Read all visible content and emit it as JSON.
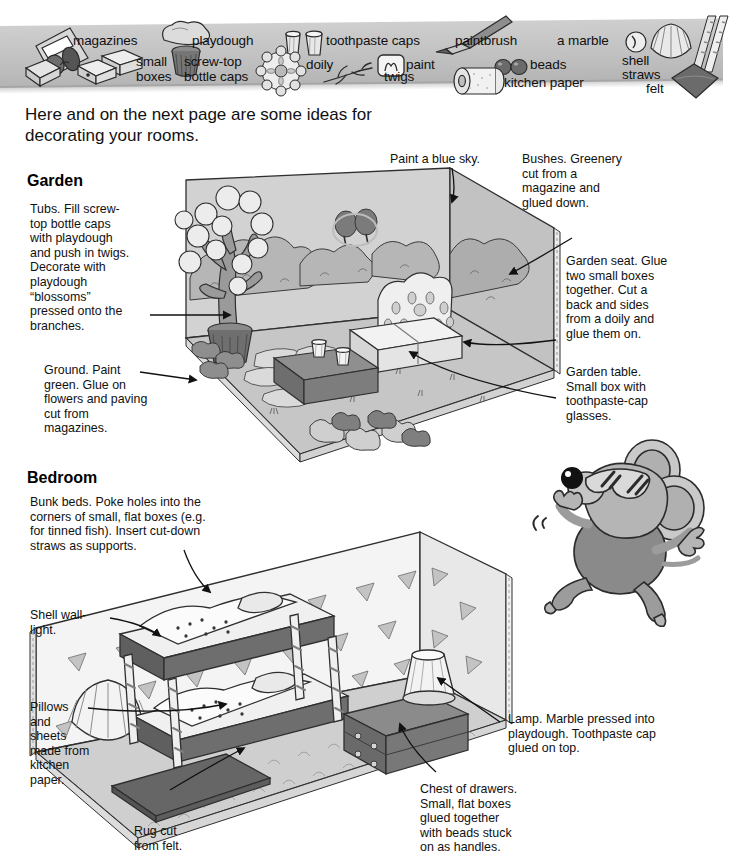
{
  "page": {
    "intro": "Here and on the next page are some ideas for decorating your rooms."
  },
  "banner": {
    "name": "materials-banner",
    "materials": [
      {
        "id": "magazines",
        "label": "magazines",
        "icon": "magazine-icon"
      },
      {
        "id": "small-boxes",
        "label": "small\nboxes",
        "icon": "small-boxes-icon"
      },
      {
        "id": "playdough",
        "label": "playdough",
        "icon": "playdough-blob-icon"
      },
      {
        "id": "screw-top-caps",
        "label": "screw-top\nbottle caps",
        "icon": "bottle-cap-icon"
      },
      {
        "id": "toothpaste-caps",
        "label": "toothpaste caps",
        "icon": "toothpaste-cap-icon"
      },
      {
        "id": "doily",
        "label": "doily",
        "icon": "doily-icon"
      },
      {
        "id": "twigs",
        "label": "twigs",
        "icon": "twig-icon"
      },
      {
        "id": "paint",
        "label": "paint",
        "icon": "paint-pot-icon"
      },
      {
        "id": "paintbrush",
        "label": "paintbrush",
        "icon": "paintbrush-icon"
      },
      {
        "id": "beads",
        "label": "beads",
        "icon": "beads-icon"
      },
      {
        "id": "kitchen-paper",
        "label": "kitchen paper",
        "icon": "kitchen-paper-roll-icon"
      },
      {
        "id": "a-marble",
        "label": "a marble",
        "icon": "marble-icon"
      },
      {
        "id": "shell",
        "label": "shell",
        "icon": "shell-icon"
      },
      {
        "id": "straws",
        "label": "straws",
        "icon": "straws-icon"
      },
      {
        "id": "felt",
        "label": "felt",
        "icon": "felt-square-icon"
      }
    ]
  },
  "garden": {
    "heading": "Garden",
    "callouts": [
      {
        "id": "tubs",
        "text": "Tubs. Fill screw-\ntop bottle caps\nwith playdough\nand push in twigs.\nDecorate with\nplaydough\n“blossoms”\npressed onto the\nbranches."
      },
      {
        "id": "ground",
        "text": "Ground. Paint\ngreen. Glue on\nflowers and paving\ncut from\nmagazines."
      },
      {
        "id": "blue-sky",
        "text": "Paint a blue sky."
      },
      {
        "id": "bushes",
        "text": "Bushes. Greenery\ncut from a\nmagazine and\nglued down."
      },
      {
        "id": "garden-seat",
        "text": "Garden seat. Glue\ntwo small boxes\ntogether. Cut a\nback and sides\nfrom a doily and\nglue them on."
      },
      {
        "id": "garden-table",
        "text": "Garden table.\nSmall box with\ntoothpaste-cap\nglasses."
      }
    ]
  },
  "bedroom": {
    "heading": "Bedroom",
    "callouts": [
      {
        "id": "bunk-beds",
        "text": "Bunk beds. Poke holes into the\ncorners of small, flat boxes (e.g.\nfor tinned fish). Insert cut-down\nstraws as supports."
      },
      {
        "id": "shell-wall-light",
        "text": "Shell wall-\nlight."
      },
      {
        "id": "pillows-sheets",
        "text": "Pillows\nand\nsheets\nmade from\nkitchen\npaper."
      },
      {
        "id": "rug",
        "text": "Rug cut\nfrom felt."
      },
      {
        "id": "lamp",
        "text": "Lamp. Marble pressed into\nplaydough. Toothpaste cap\nglued on top."
      },
      {
        "id": "chest-of-drawers",
        "text": "Chest of drawers.\nSmall, flat boxes\nglued together\nwith beads stuck\non as handles."
      }
    ]
  },
  "illustrations": [
    {
      "id": "garden-diorama",
      "name": "garden-room-illustration"
    },
    {
      "id": "bedroom-diorama",
      "name": "bedroom-room-illustration"
    },
    {
      "id": "mouse",
      "name": "cartoon-mouse-with-sunglasses"
    }
  ],
  "colors": {
    "ink": "#111111",
    "banner_light": "#cfcfcf",
    "banner_dark": "#b4b4b4",
    "grey_light": "#dcdcdc",
    "grey_mid": "#b9b9b9",
    "grey_dark": "#8d8d8d",
    "grey_darker": "#6e6e6e",
    "paper": "#ffffff"
  }
}
